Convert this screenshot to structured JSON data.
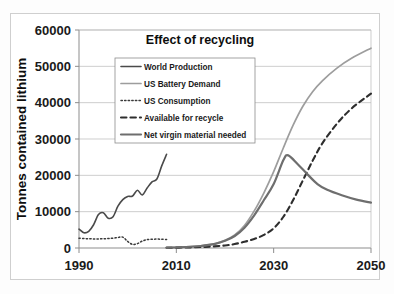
{
  "chart_data": {
    "type": "line",
    "title": "Effect of recycling",
    "xlabel": "",
    "ylabel": "Tonnes contained lithium",
    "xlim": [
      1990,
      2050
    ],
    "ylim": [
      0,
      60000
    ],
    "xticks": [
      1990,
      2010,
      2030,
      2050
    ],
    "xtick_labels": [
      "1990",
      "2010",
      "2030",
      "2050"
    ],
    "yticks": [
      0,
      10000,
      20000,
      30000,
      40000,
      50000,
      60000
    ],
    "ytick_labels": [
      "0",
      "10000",
      "20000",
      "30000",
      "40000",
      "50000",
      "60000"
    ],
    "grid": "horizontal",
    "legend_position": "upper-left-inside",
    "series": [
      {
        "name": "World Production",
        "style": "solid",
        "color": "#4a4a4a",
        "width": 1.6,
        "x": [
          1990,
          1991,
          1992,
          1993,
          1994,
          1995,
          1996,
          1997,
          1998,
          1999,
          2000,
          2001,
          2002,
          2003,
          2004,
          2005,
          2006,
          2007,
          2008
        ],
        "y": [
          5200,
          4200,
          4600,
          6400,
          9200,
          9700,
          8200,
          8600,
          11500,
          13300,
          14200,
          14300,
          15900,
          14600,
          16500,
          18200,
          19000,
          22600,
          25800
        ]
      },
      {
        "name": "US Battery Demand",
        "style": "solid",
        "color": "#9d9d9d",
        "width": 1.7,
        "x": [
          2008,
          2012,
          2015,
          2018,
          2020,
          2022,
          2024,
          2026,
          2028,
          2030,
          2032,
          2034,
          2036,
          2038,
          2040,
          2043,
          2046,
          2050
        ],
        "y": [
          120,
          300,
          600,
          1200,
          2100,
          3600,
          6200,
          10200,
          15200,
          21000,
          27600,
          33800,
          39000,
          43000,
          46000,
          49500,
          52200,
          55000
        ]
      },
      {
        "name": "US Consumption",
        "style": "dotted",
        "color": "#3a3a3a",
        "width": 1.5,
        "x": [
          1990,
          1991,
          1992,
          1993,
          1994,
          1995,
          1996,
          1997,
          1998,
          1999,
          2000,
          2001,
          2002,
          2003,
          2004,
          2005,
          2006,
          2007,
          2008
        ],
        "y": [
          2700,
          2600,
          2550,
          2500,
          2500,
          2550,
          2600,
          2700,
          2900,
          3000,
          1800,
          1000,
          1200,
          1900,
          2300,
          2400,
          2450,
          2400,
          2350
        ]
      },
      {
        "name": "Available for recycle",
        "style": "dashed",
        "color": "#2e2e2e",
        "width": 2.1,
        "x": [
          2008,
          2012,
          2016,
          2020,
          2022,
          2024,
          2026,
          2028,
          2030,
          2032,
          2034,
          2036,
          2038,
          2040,
          2043,
          2046,
          2050
        ],
        "y": [
          60,
          150,
          320,
          700,
          1100,
          1700,
          2500,
          3600,
          5400,
          8600,
          13200,
          18600,
          24000,
          28800,
          34200,
          38400,
          42500
        ]
      },
      {
        "name": "Net virgin material needed",
        "style": "solid",
        "color": "#6e6e6e",
        "width": 2.2,
        "x": [
          2008,
          2012,
          2015,
          2018,
          2020,
          2022,
          2024,
          2026,
          2028,
          2030,
          2032,
          2033,
          2035,
          2037,
          2039,
          2041,
          2044,
          2047,
          2050
        ],
        "y": [
          100,
          280,
          560,
          1150,
          2000,
          3300,
          5600,
          9000,
          13200,
          17600,
          24200,
          25500,
          23000,
          20200,
          17600,
          16000,
          14500,
          13300,
          12500
        ]
      }
    ]
  }
}
